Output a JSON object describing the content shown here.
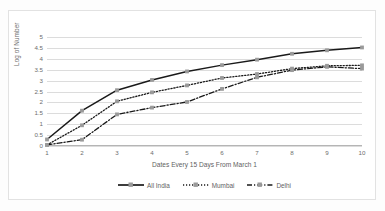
{
  "chart_data": {
    "type": "line",
    "title": "",
    "xlabel": "Dates Every 15 Days From March 1",
    "ylabel": "Log of Number",
    "x": [
      1,
      2,
      3,
      4,
      5,
      6,
      7,
      8,
      9,
      10
    ],
    "xtick_labels": [
      "1",
      "2",
      "3",
      "4",
      "5",
      "6",
      "7",
      "8",
      "9",
      "10"
    ],
    "ytick_labels": [
      "0",
      "0.5",
      "1",
      "1.5",
      "2",
      "2.5",
      "3",
      "3.5",
      "4",
      "4.5",
      "5"
    ],
    "ytick_values": [
      0,
      0.5,
      1,
      1.5,
      2,
      2.5,
      3,
      3.5,
      4,
      4.5,
      5
    ],
    "xlim": [
      1,
      10
    ],
    "ylim": [
      0,
      5
    ],
    "grid": "horizontal",
    "legend_position": "bottom",
    "series": [
      {
        "name": "All India",
        "values": [
          0.3,
          1.62,
          2.56,
          3.03,
          3.42,
          3.71,
          3.96,
          4.23,
          4.39,
          4.52
        ],
        "style": "solid",
        "color": "#1a1a1a",
        "marker": "square"
      },
      {
        "name": "Mumbai",
        "values": [
          0.05,
          0.95,
          2.05,
          2.46,
          2.78,
          3.12,
          3.3,
          3.55,
          3.68,
          3.7
        ],
        "style": "dotted",
        "color": "#1a1a1a",
        "marker": "square"
      },
      {
        "name": "Delhi",
        "values": [
          0.05,
          0.29,
          1.45,
          1.76,
          2.02,
          2.62,
          3.15,
          3.48,
          3.63,
          3.55
        ],
        "style": "dash-dot",
        "color": "#1a1a1a",
        "marker": "square"
      }
    ]
  },
  "legend": {
    "items": [
      {
        "label": "All India"
      },
      {
        "label": "Mumbai"
      },
      {
        "label": "Delhi"
      }
    ]
  },
  "colors": {
    "gridline": "#dcdcdc",
    "axis_text": "#6d6d6d",
    "series_line": "#1a1a1a",
    "marker_fill": "#9a9a9a",
    "frame_border": "#e2e2e2",
    "background": "#ffffff"
  }
}
